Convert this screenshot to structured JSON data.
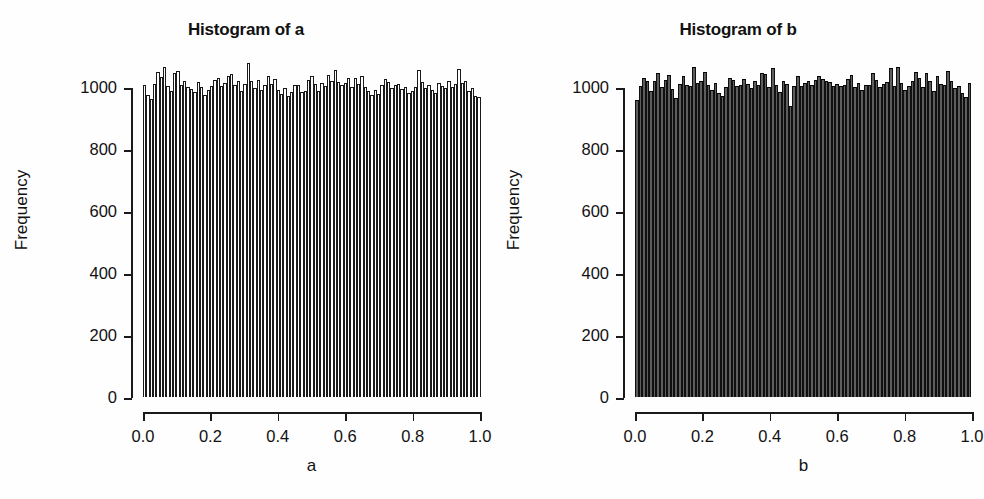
{
  "figure": {
    "background": "#ffffff",
    "foreground": "#111111",
    "width": 984,
    "height": 499
  },
  "panels": [
    {
      "id": "a",
      "title": "Histogram of a",
      "xlabel": "a",
      "ylabel": "Frequency",
      "bar_fill": "#ffffff",
      "bar_border": "#1a1a1a"
    },
    {
      "id": "b",
      "title": "Histogram of b",
      "xlabel": "b",
      "ylabel": "Frequency",
      "bar_fill": "#5e5e5e",
      "bar_border": "#101010"
    }
  ],
  "axes": {
    "y_ticks": [
      "0",
      "200",
      "400",
      "600",
      "800",
      "1000"
    ],
    "y_values": [
      0,
      200,
      400,
      600,
      800,
      1000
    ],
    "x_ticks": [
      "0.0",
      "0.2",
      "0.4",
      "0.6",
      "0.8",
      "1.0"
    ],
    "x_values": [
      0.0,
      0.2,
      0.4,
      0.6,
      0.8,
      1.0
    ],
    "ylim": [
      0,
      1100
    ],
    "xlim": [
      0.0,
      1.0
    ],
    "grid": false
  },
  "chart_data": [
    {
      "type": "bar",
      "id": "a",
      "title": "Histogram of a",
      "xlabel": "a",
      "ylabel": "Frequency",
      "xlim": [
        0.0,
        1.0
      ],
      "ylim": [
        0,
        1100
      ],
      "grid": false,
      "legend": null,
      "bins": 100,
      "bin_width": 0.01,
      "total_count": 100000,
      "categories": [
        "0.00",
        "0.01",
        "0.02",
        "0.03",
        "0.04",
        "0.05",
        "0.06",
        "0.07",
        "0.08",
        "0.09",
        "0.10",
        "0.11",
        "0.12",
        "0.13",
        "0.14",
        "0.15",
        "0.16",
        "0.17",
        "0.18",
        "0.19",
        "0.20",
        "0.21",
        "0.22",
        "0.23",
        "0.24",
        "0.25",
        "0.26",
        "0.27",
        "0.28",
        "0.29",
        "0.30",
        "0.31",
        "0.32",
        "0.33",
        "0.34",
        "0.35",
        "0.36",
        "0.37",
        "0.38",
        "0.39",
        "0.40",
        "0.41",
        "0.42",
        "0.43",
        "0.44",
        "0.45",
        "0.46",
        "0.47",
        "0.48",
        "0.49",
        "0.50",
        "0.51",
        "0.52",
        "0.53",
        "0.54",
        "0.55",
        "0.56",
        "0.57",
        "0.58",
        "0.59",
        "0.60",
        "0.61",
        "0.62",
        "0.63",
        "0.64",
        "0.65",
        "0.66",
        "0.67",
        "0.68",
        "0.69",
        "0.70",
        "0.71",
        "0.72",
        "0.73",
        "0.74",
        "0.75",
        "0.76",
        "0.77",
        "0.78",
        "0.79",
        "0.80",
        "0.81",
        "0.82",
        "0.83",
        "0.84",
        "0.85",
        "0.86",
        "0.87",
        "0.88",
        "0.89",
        "0.90",
        "0.91",
        "0.92",
        "0.93",
        "0.94",
        "0.95",
        "0.96",
        "0.97",
        "0.98",
        "0.99"
      ],
      "values": [
        1005,
        975,
        962,
        1010,
        1048,
        1031,
        1063,
        1003,
        988,
        1044,
        1052,
        1008,
        1018,
        1000,
        994,
        983,
        1016,
        1000,
        974,
        989,
        1004,
        1023,
        1029,
        1002,
        1012,
        1037,
        1042,
        1008,
        1018,
        988,
        1011,
        1079,
        1018,
        996,
        1022,
        990,
        1006,
        1034,
        1011,
        1025,
        990,
        979,
        996,
        970,
        984,
        1006,
        1008,
        984,
        988,
        1022,
        1034,
        1009,
        987,
        1014,
        1002,
        1040,
        1021,
        1054,
        1016,
        1007,
        1012,
        1029,
        1000,
        1028,
        1010,
        1036,
        1000,
        988,
        975,
        990,
        979,
        1006,
        1026,
        1016,
        998,
        1008,
        1010,
        994,
        1001,
        982,
        986,
        1001,
        1056,
        1016,
        998,
        1007,
        990,
        982,
        1012,
        1004,
        998,
        1020,
        1000,
        1010,
        1058,
        1012,
        1020,
        988,
        998,
        972,
        968
      ]
    },
    {
      "type": "bar",
      "id": "b",
      "title": "Histogram of b",
      "xlabel": "b",
      "ylabel": "Frequency",
      "xlim": [
        0.0,
        1.0
      ],
      "ylim": [
        0,
        1100
      ],
      "grid": false,
      "legend": null,
      "bins": 100,
      "bin_width": 0.01,
      "total_count": 100000,
      "categories": [
        "0.00",
        "0.01",
        "0.02",
        "0.03",
        "0.04",
        "0.05",
        "0.06",
        "0.07",
        "0.08",
        "0.09",
        "0.10",
        "0.11",
        "0.12",
        "0.13",
        "0.14",
        "0.15",
        "0.16",
        "0.17",
        "0.18",
        "0.19",
        "0.20",
        "0.21",
        "0.22",
        "0.23",
        "0.24",
        "0.25",
        "0.26",
        "0.27",
        "0.28",
        "0.29",
        "0.30",
        "0.31",
        "0.32",
        "0.33",
        "0.34",
        "0.35",
        "0.36",
        "0.37",
        "0.38",
        "0.39",
        "0.40",
        "0.41",
        "0.42",
        "0.43",
        "0.44",
        "0.45",
        "0.46",
        "0.47",
        "0.48",
        "0.49",
        "0.50",
        "0.51",
        "0.52",
        "0.53",
        "0.54",
        "0.55",
        "0.56",
        "0.57",
        "0.58",
        "0.59",
        "0.60",
        "0.61",
        "0.62",
        "0.63",
        "0.64",
        "0.65",
        "0.66",
        "0.67",
        "0.68",
        "0.69",
        "0.70",
        "0.71",
        "0.72",
        "0.73",
        "0.74",
        "0.75",
        "0.76",
        "0.77",
        "0.78",
        "0.79",
        "0.80",
        "0.81",
        "0.82",
        "0.83",
        "0.84",
        "0.85",
        "0.86",
        "0.87",
        "0.88",
        "0.89",
        "0.90",
        "0.91",
        "0.92",
        "0.93",
        "0.94",
        "0.95",
        "0.96",
        "0.97",
        "0.98",
        "0.99"
      ],
      "values": [
        958,
        1002,
        1030,
        1020,
        988,
        1018,
        1044,
        1000,
        1024,
        1038,
        992,
        964,
        1010,
        1034,
        1006,
        1003,
        1066,
        1012,
        1018,
        1048,
        1008,
        990,
        1012,
        982,
        970,
        1000,
        1030,
        1023,
        1002,
        1008,
        1026,
        1010,
        996,
        1019,
        1005,
        1044,
        1042,
        1001,
        1062,
        1008,
        983,
        1020,
        1010,
        938,
        1004,
        1036,
        1002,
        1014,
        1020,
        1008,
        1022,
        1034,
        1026,
        1018,
        1016,
        1003,
        1010,
        1002,
        1006,
        1026,
        1038,
        1000,
        1014,
        990,
        1006,
        1008,
        1044,
        1022,
        1000,
        1009,
        1016,
        1060,
        1002,
        1066,
        1012,
        990,
        1004,
        1018,
        1048,
        1030,
        1000,
        1044,
        1020,
        988,
        1034,
        1010,
        1006,
        1052,
        1020,
        998,
        1002,
        980,
        968,
        1014
      ]
    }
  ]
}
